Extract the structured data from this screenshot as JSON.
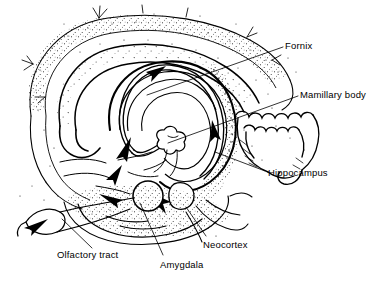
{
  "figure": {
    "kind": "anatomical-line-drawing",
    "width": 385,
    "height": 281,
    "background_color": "#ffffff",
    "ink_color": "#000000",
    "technique": "pen-and-ink stipple with hatching"
  },
  "labels": [
    {
      "id": "fornix",
      "text": "Fornix",
      "x": 285,
      "y": 41,
      "leader": {
        "x1": 283,
        "y1": 47,
        "x2": 147,
        "y2": 95
      }
    },
    {
      "id": "mamillary-body",
      "text": "Mamillary body",
      "x": 300,
      "y": 90,
      "leader": {
        "x1": 298,
        "y1": 96,
        "x2": 168,
        "y2": 143
      }
    },
    {
      "id": "hippocampus",
      "text": "Hippocampus",
      "x": 268,
      "y": 168,
      "leader": {
        "x1": 265,
        "y1": 171,
        "x2": 215,
        "y2": 152
      }
    },
    {
      "id": "olfactory-tract",
      "text": "Olfactory tract",
      "x": 57,
      "y": 250,
      "leader": {
        "x1": 92,
        "y1": 248,
        "x2": 62,
        "y2": 219
      }
    },
    {
      "id": "amygdala",
      "text": "Amygdala",
      "x": 160,
      "y": 260,
      "leader": {
        "x1": 163,
        "y1": 255,
        "x2": 140,
        "y2": 203
      }
    },
    {
      "id": "neocortex",
      "text": "Neocortex",
      "x": 203,
      "y": 240,
      "leader": {
        "x1": 206,
        "y1": 236,
        "x2": 186,
        "y2": 207
      }
    }
  ],
  "structures": [
    {
      "id": "neocortex-outline",
      "name": "Neocortex outer mantle"
    },
    {
      "id": "cingulate-gyrus",
      "name": "Cingulate gyrus band"
    },
    {
      "id": "corpus-callosum",
      "name": "Corpus callosum ring"
    },
    {
      "id": "fornix-arc",
      "name": "Fornix arc"
    },
    {
      "id": "mamillary-body-node",
      "name": "Mamillary body"
    },
    {
      "id": "hippocampal-scallops",
      "name": "Hippocampal folded cortex"
    },
    {
      "id": "amygdala-node",
      "name": "Amygdala"
    },
    {
      "id": "olfactory-bulb-tract",
      "name": "Olfactory bulb and tract"
    },
    {
      "id": "flow-arrows",
      "name": "Pathway direction arrows"
    }
  ]
}
